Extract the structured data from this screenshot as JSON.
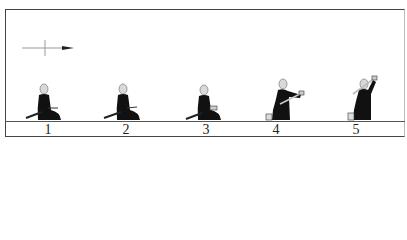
{
  "diagram": {
    "title": "",
    "direction_indicator": "arrow-right",
    "steps": [
      {
        "label": "1",
        "pose": "seated-seiza-sword-at-side"
      },
      {
        "label": "2",
        "pose": "seated-seiza-hand-on-sword"
      },
      {
        "label": "3",
        "pose": "seated-gripping-sword"
      },
      {
        "label": "4",
        "pose": "rising-to-knee-drawing-sword"
      },
      {
        "label": "5",
        "pose": "kneeling-sword-raised-overhead"
      }
    ]
  },
  "colors": {
    "figure": "#111111",
    "head": "#d9d9d9",
    "line": "#555555",
    "background": "#ffffff"
  }
}
